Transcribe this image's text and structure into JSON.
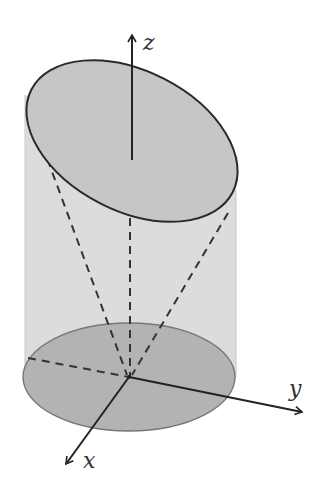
{
  "diagram": {
    "axes": {
      "z": {
        "label": "z"
      },
      "y": {
        "label": "y"
      },
      "x": {
        "label": "x"
      }
    },
    "colors": {
      "background": "#ffffff",
      "cylinder_side": "#dcdcdc",
      "top_ellipse": "#c6c6c6",
      "bottom_ellipse": "#b3b3b3",
      "stroke": "#2a2a2a"
    }
  }
}
